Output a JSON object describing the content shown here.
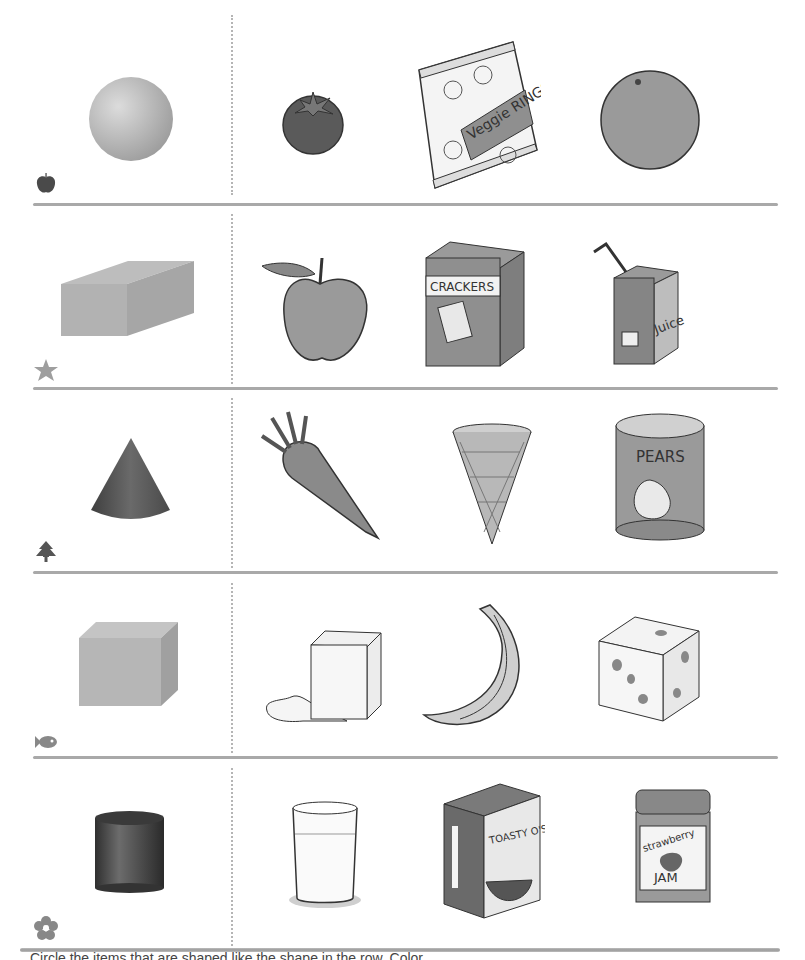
{
  "worksheet": {
    "title": "Match shapes to food items",
    "rows": [
      {
        "row_icon": "apple-icon",
        "shape": "sphere",
        "items": [
          {
            "name": "tomato",
            "label": ""
          },
          {
            "name": "veggie-rings-bag",
            "label": "Veggie RINGS"
          },
          {
            "name": "orange",
            "label": ""
          }
        ]
      },
      {
        "row_icon": "star-icon",
        "shape": "rectangular-prism",
        "items": [
          {
            "name": "apple",
            "label": ""
          },
          {
            "name": "crackers-box",
            "label": "CRACKERS"
          },
          {
            "name": "juice-box",
            "label": "Juice"
          }
        ]
      },
      {
        "row_icon": "tree-icon",
        "shape": "cone",
        "items": [
          {
            "name": "carrot",
            "label": ""
          },
          {
            "name": "ice-cream-cone",
            "label": ""
          },
          {
            "name": "pears-can",
            "label": "PEARS"
          }
        ]
      },
      {
        "row_icon": "fish-icon",
        "shape": "cube",
        "items": [
          {
            "name": "ice-cube",
            "label": ""
          },
          {
            "name": "banana",
            "label": ""
          },
          {
            "name": "cheese-cube",
            "label": ""
          }
        ]
      },
      {
        "row_icon": "flower-icon",
        "shape": "cylinder",
        "items": [
          {
            "name": "glass-of-milk",
            "label": ""
          },
          {
            "name": "cereal-box",
            "label": "TOASTY O'S"
          },
          {
            "name": "jam-jar",
            "label": "strawberry JAM"
          }
        ]
      }
    ],
    "footer_text": "Circle the items that are shaped like the shape in the row. Color ..."
  },
  "colors": {
    "divider": "#a9a9a9",
    "dots": "#b5b5b5",
    "shape_light": "#c8c8c8",
    "shape_dark": "#555555"
  }
}
